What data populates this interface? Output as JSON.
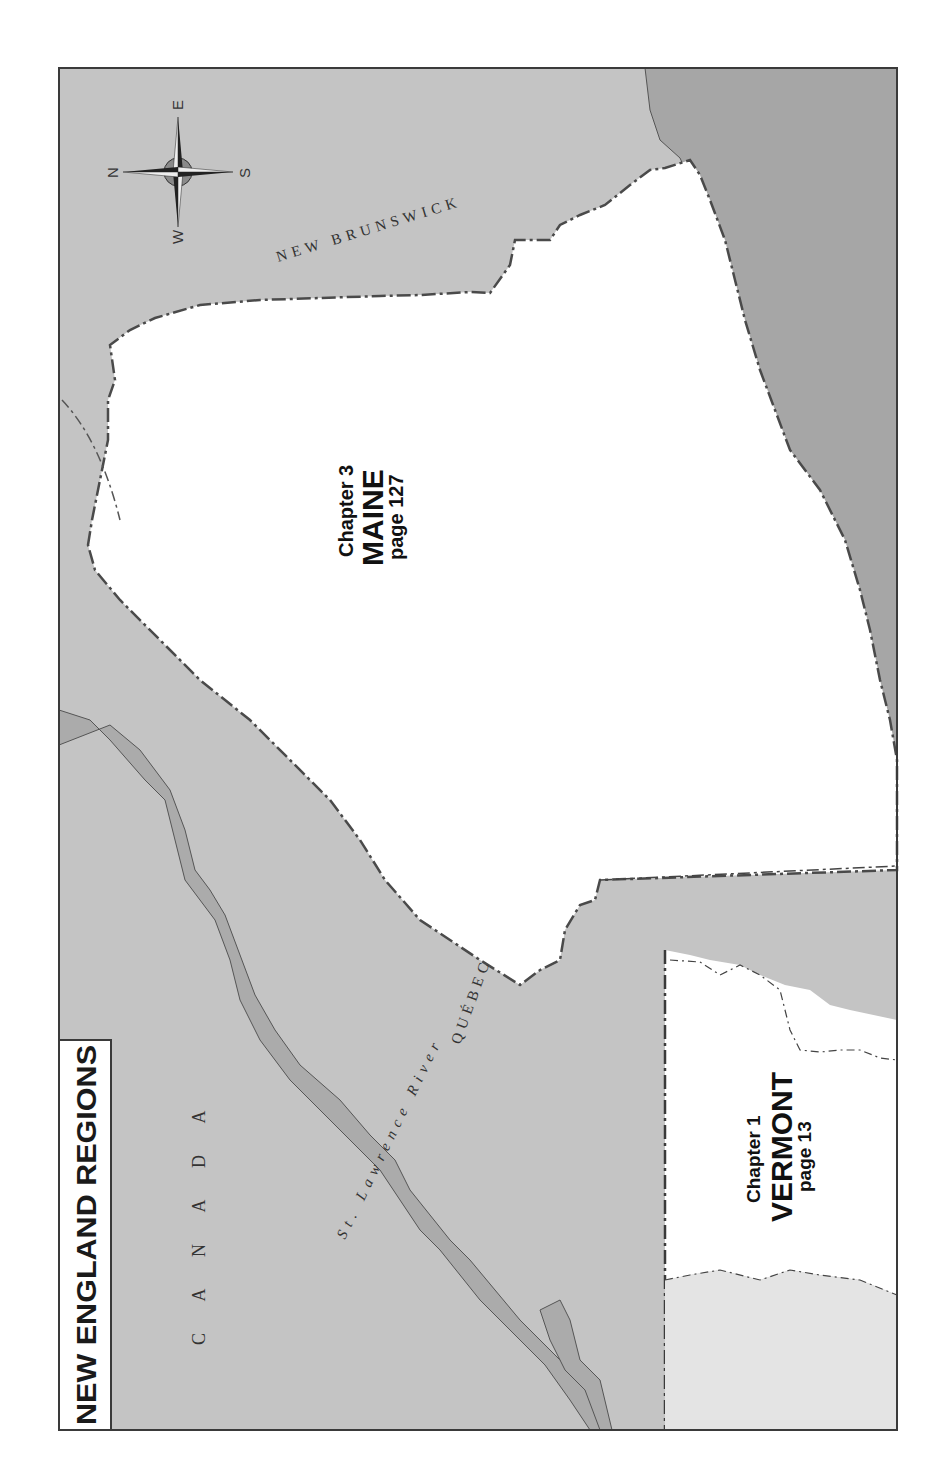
{
  "map": {
    "title": "NEW ENGLAND REGIONS",
    "orientation": "rotated 90deg (north points left)",
    "colors": {
      "land_foreign": "#c4c4c4",
      "water": "#a9a9a9",
      "region_highlight": "#ffffff",
      "region_adjacent": "#e4e4e4",
      "border": "#4a4a4a",
      "text": "#1a1a1a"
    },
    "compass": {
      "north": "N",
      "south": "S",
      "east": "E",
      "west": "W"
    },
    "place_labels": {
      "country": "C A N A D A",
      "province_east": "NEW BRUNSWICK",
      "province_west": "QUÉBEC",
      "river": "St. Lawrence River"
    },
    "regions": [
      {
        "chapter": "Chapter 3",
        "name": "MAINE",
        "page": "page 127"
      },
      {
        "chapter": "Chapter 1",
        "name": "VERMONT",
        "page": "page 13"
      }
    ]
  }
}
